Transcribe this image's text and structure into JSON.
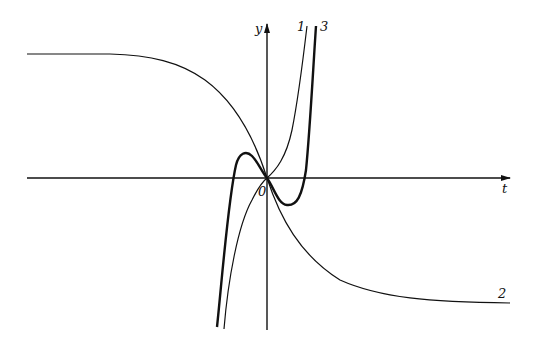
{
  "figure": {
    "axes": {
      "x_label": "t",
      "y_label": "y",
      "origin_label": "0"
    },
    "curves": [
      {
        "id": "1",
        "label": "1",
        "description": "thin odd increasing curve through origin"
      },
      {
        "id": "2",
        "label": "2",
        "description": "decreasing curve with horizontal asymptotes"
      },
      {
        "id": "3",
        "label": "3",
        "description": "thick cubic-like curve with local max left of origin and local min right of origin"
      }
    ],
    "colors": {
      "stroke": "#111111",
      "background": "#ffffff"
    }
  }
}
